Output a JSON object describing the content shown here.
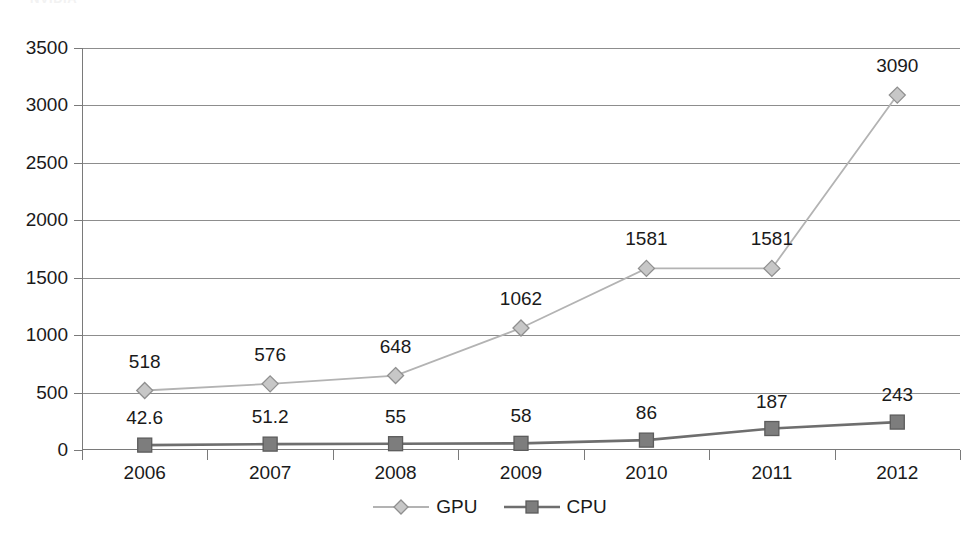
{
  "title_remnant": "NVIDIA",
  "chart_data": {
    "type": "line",
    "title": "",
    "xlabel": "",
    "ylabel": "",
    "categories": [
      "2006",
      "2007",
      "2008",
      "2009",
      "2010",
      "2011",
      "2012"
    ],
    "ylim": [
      0,
      3500
    ],
    "ytick_values": [
      0,
      500,
      1000,
      1500,
      2000,
      2500,
      3000,
      3500
    ],
    "ytick_labels": [
      "0",
      "500",
      "1000",
      "1500",
      "2000",
      "2500",
      "3000",
      "3500"
    ],
    "grid": "horizontal",
    "legend_position": "bottom-center",
    "series": [
      {
        "name": "GPU",
        "marker": "diamond",
        "color": "#b3b3b3",
        "marker_fill": "#c7c7c7",
        "marker_stroke": "#8f8f8f",
        "values": [
          518,
          576,
          648,
          1062,
          1581,
          1581,
          3090
        ],
        "labels": [
          "518",
          "576",
          "648",
          "1062",
          "1581",
          "1581",
          "3090"
        ]
      },
      {
        "name": "CPU",
        "marker": "square",
        "color": "#6e6e6e",
        "marker_fill": "#7d7d7d",
        "marker_stroke": "#5c5c5c",
        "values": [
          42.6,
          51.2,
          55,
          58,
          86,
          187,
          243
        ],
        "labels": [
          "42.6",
          "51.2",
          "55",
          "58",
          "86",
          "187",
          "243"
        ]
      }
    ]
  },
  "legend": {
    "items": [
      {
        "label": "GPU",
        "icon": "diamond-marker-icon"
      },
      {
        "label": "CPU",
        "icon": "square-marker-icon"
      }
    ]
  },
  "colors": {
    "axis": "#7a7a7a",
    "gridline": "#8d8d8d",
    "text": "#1a1a1a",
    "gpu": "#b3b3b3",
    "cpu": "#6e6e6e",
    "background": "#ffffff"
  }
}
